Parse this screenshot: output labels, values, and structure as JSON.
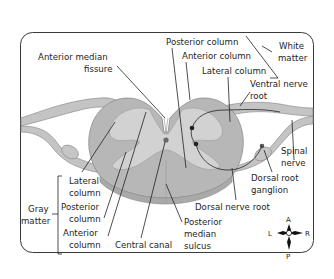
{
  "diagram": {
    "colors": {
      "frame": "#3a3a3a",
      "white_matter": "#b7b7b7",
      "gray_matter": "#cfcfcf",
      "nerve": "#c4c4c4",
      "nerve_outline": "#8e8e8e",
      "leader_line": "#222222"
    },
    "labels": {
      "anterior_median_fissure_1": "Anterior median",
      "anterior_median_fissure_2": "fissure",
      "posterior_column_wm": "Posterior column",
      "anterior_column_wm": "Anterior column",
      "lateral_column_wm": "Lateral column",
      "white_matter_1": "White",
      "white_matter_2": "matter",
      "ventral_nerve_root_1": "Ventral nerve",
      "ventral_nerve_root_2": "root",
      "spinal_nerve_1": "Spinal",
      "spinal_nerve_2": "nerve",
      "dorsal_root_ganglion_1": "Dorsal root",
      "dorsal_root_ganglion_2": "ganglion",
      "dorsal_nerve_root": "Dorsal nerve root",
      "posterior_median_sulcus_1": "Posterior",
      "posterior_median_sulcus_2": "median",
      "posterior_median_sulcus_3": "sulcus",
      "central_canal": "Central canal",
      "gray_matter_1": "Gray",
      "gray_matter_2": "matter",
      "lateral_column_gm_1": "Lateral",
      "lateral_column_gm_2": "column",
      "posterior_column_gm_1": "Posterior",
      "posterior_column_gm_2": "column",
      "anterior_column_gm_1": "Anterior",
      "anterior_column_gm_2": "column"
    },
    "compass": {
      "top": "A",
      "bottom": "P",
      "left": "L",
      "right": "R"
    }
  }
}
